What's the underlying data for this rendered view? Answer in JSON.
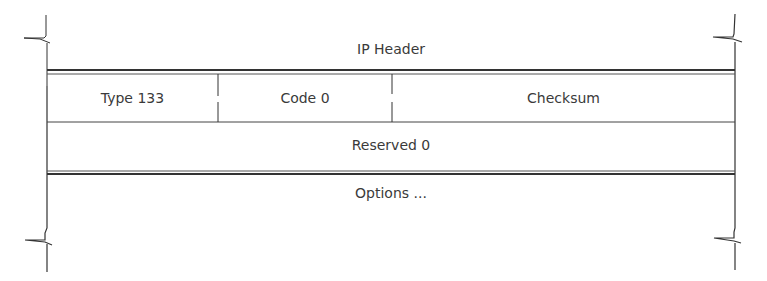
{
  "diagram": {
    "top_section": {
      "label": "IP Header"
    },
    "row1": {
      "fields": [
        {
          "label": "Type 133"
        },
        {
          "label": "Code 0"
        },
        {
          "label": "Checksum"
        }
      ]
    },
    "row2": {
      "label": "Reserved 0"
    },
    "bottom_section": {
      "label": "Options ..."
    },
    "line_color": "#333333"
  }
}
